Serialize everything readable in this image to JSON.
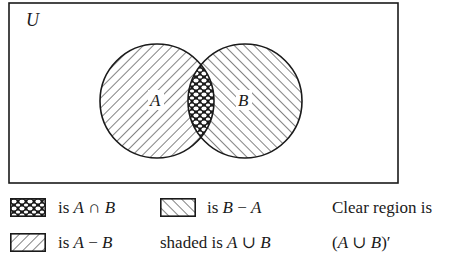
{
  "diagram": {
    "type": "venn",
    "universe_label": "U",
    "sets": [
      {
        "label": "A",
        "cx": 157,
        "cy": 101,
        "r": 57,
        "pattern": "backslash-hatch"
      },
      {
        "label": "B",
        "cx": 245,
        "cy": 101,
        "r": 57,
        "pattern": "forwardslash-hatch"
      }
    ],
    "intersection_pattern": "crosshatch-scale",
    "line_color": "#1a1a1a",
    "background": "#ffffff"
  },
  "legend": {
    "intersection": {
      "prefix": "is ",
      "set1": "A",
      "op": " ∩ ",
      "set2": "B"
    },
    "b_minus_a": {
      "prefix": "is ",
      "set1": "B",
      "op": " − ",
      "set2": "A"
    },
    "clear_region_line1": "Clear region is",
    "a_minus_b": {
      "prefix": "is ",
      "set1": "A",
      "op": " − ",
      "set2": "B"
    },
    "shaded": {
      "prefix": "shaded is ",
      "set1": "A",
      "op": " ∪ ",
      "set2": "B"
    },
    "clear_region_line2": {
      "open": "(",
      "set1": "A",
      "op": " ∪ ",
      "set2": "B",
      "close": ")′"
    }
  }
}
